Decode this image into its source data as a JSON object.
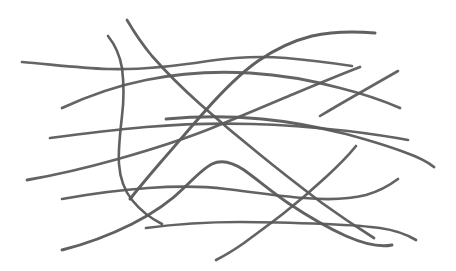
{
  "document": {
    "title": "Fiber Network Line Drawing",
    "kind": "line-drawing",
    "subject": "overlapping curved fibers / filaments",
    "width": 456,
    "height": 271,
    "background_color": "#ffffff",
    "stroke_color": "#5a5a5a",
    "stroke_style": "hand-drawn pencil / ink curves",
    "stroke_count": 13
  },
  "palette": {
    "background": "#ffffff",
    "ink": "#5a5a5a",
    "ink_light": "#6b6b6b",
    "ink_dark": "#4e4e4e"
  },
  "strokes": [
    {
      "id": "fiber-1",
      "name": "upper-left-long-horizontal",
      "color": "#5d5d5d",
      "width": 2.6,
      "opacity": 0.95,
      "d": "M22,62 C48,64 78,68 108,69 C140,70 176,66 208,61 C236,57 262,56 286,58 C310,60 332,63 352,66"
    },
    {
      "id": "fiber-2",
      "name": "top-arc-right-descending",
      "color": "#5a5a5a",
      "width": 3.0,
      "opacity": 0.96,
      "d": "M375,33 C352,31 330,32 312,36 C292,41 274,50 258,61 C238,75 222,92 206,110 C190,128 175,146 160,163 C148,177 138,189 130,199"
    },
    {
      "id": "fiber-3",
      "name": "left-rising-long-diagonal",
      "color": "#5c5c5c",
      "width": 2.8,
      "opacity": 0.95,
      "d": "M62,108 C88,96 116,86 146,80 C180,73 216,71 250,73 C284,75 314,81 340,88 C364,94 384,101 400,108"
    },
    {
      "id": "fiber-4",
      "name": "top-left-steep-hook",
      "color": "#585858",
      "width": 2.6,
      "opacity": 0.95,
      "d": "M108,36 C116,46 120,56 122,68 C124,84 124,100 122,116 C120,134 118,150 119,164 C120,178 124,190 132,200 C140,210 150,218 162,224"
    },
    {
      "id": "fiber-5",
      "name": "top-second-steep-descender",
      "color": "#5a5a5a",
      "width": 2.7,
      "opacity": 0.95,
      "d": "M127,20 C134,32 142,44 152,56 C166,72 182,88 200,104 C218,120 238,137 258,153 C280,171 302,188 322,203 C340,216 358,228 374,238"
    },
    {
      "id": "fiber-6",
      "name": "mid-left-to-right-gentle-wave",
      "color": "#5b5b5b",
      "width": 2.7,
      "opacity": 0.95,
      "d": "M50,138 C80,134 112,130 146,127 C182,124 218,123 252,124 C288,125 320,128 348,131 C372,134 392,137 408,140"
    },
    {
      "id": "fiber-7",
      "name": "center-bow-right-descending",
      "color": "#5a5a5a",
      "width": 2.8,
      "opacity": 0.95,
      "d": "M166,119 C198,116 230,116 262,119 C294,122 322,128 346,134 C368,140 388,146 404,152 C418,157 428,162 434,167"
    },
    {
      "id": "fiber-8",
      "name": "lower-left-rising-long",
      "color": "#5c5c5c",
      "width": 2.8,
      "opacity": 0.95,
      "d": "M27,180 C56,175 86,168 118,159 C150,150 182,140 212,128 C242,116 270,104 296,93 C320,83 342,74 360,67"
    },
    {
      "id": "fiber-9",
      "name": "center-valley-to-right-wave",
      "color": "#5b5b5b",
      "width": 2.7,
      "opacity": 0.95,
      "d": "M62,199 C90,194 118,190 148,188 C176,186 202,186 226,189 C252,192 278,196 304,198 C328,200 350,199 366,195 C380,191 390,185 398,179"
    },
    {
      "id": "fiber-10",
      "name": "bottom-sweep-left-to-right-long",
      "color": "#595959",
      "width": 2.9,
      "opacity": 0.95,
      "d": "M62,250 C86,244 110,235 132,224 C154,213 172,200 186,186 C196,176 204,168 212,164 C222,159 232,162 244,170 C258,180 272,192 288,203 C306,215 326,227 346,236 C362,243 378,248 392,245"
    },
    {
      "id": "fiber-11",
      "name": "bottom-horizontal-long-run",
      "color": "#5a5a5a",
      "width": 2.7,
      "opacity": 0.95,
      "d": "M146,228 C176,224 208,222 240,222 C272,222 300,223 326,224 C348,225 366,226 380,228 C394,230 406,234 416,240"
    },
    {
      "id": "fiber-12",
      "name": "right-upper-short-diagonal",
      "color": "#5a5a5a",
      "width": 2.6,
      "opacity": 0.94,
      "d": "M398,71 C384,79 370,87 356,95 C342,103 330,110 320,116"
    },
    {
      "id": "fiber-13",
      "name": "mid-right-descender-to-bottom",
      "color": "#5b5b5b",
      "width": 2.7,
      "opacity": 0.95,
      "d": "M356,146 C348,156 338,166 326,177 C312,190 298,202 284,213 C270,224 256,234 244,243 C234,250 224,256 216,260"
    }
  ],
  "accessibility": {
    "alt_text": "A hand-drawn black-and-white sketch of about thirteen long, gently curving lines that cross and overlap one another, resembling a loose tangle of fibers or filaments on a white background."
  }
}
